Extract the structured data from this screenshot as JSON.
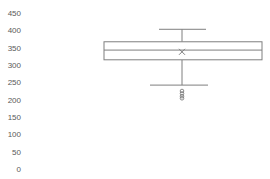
{
  "chart_data": {
    "type": "box",
    "title": "",
    "xlabel": "",
    "ylabel": "",
    "ylim": [
      0,
      450
    ],
    "yticks": [
      0,
      50,
      100,
      150,
      200,
      250,
      300,
      350,
      400,
      450
    ],
    "grid": false,
    "legend": null,
    "series": [
      {
        "name": "Series 1",
        "min": 242,
        "q1": 315,
        "median": 343,
        "mean": 338,
        "q3": 367,
        "max": 403,
        "outliers": [
          225,
          218,
          210,
          204
        ]
      }
    ]
  },
  "style": {
    "stroke": "#7f7f7f",
    "box_fill": "#ffffff",
    "tick_color": "#595959"
  }
}
